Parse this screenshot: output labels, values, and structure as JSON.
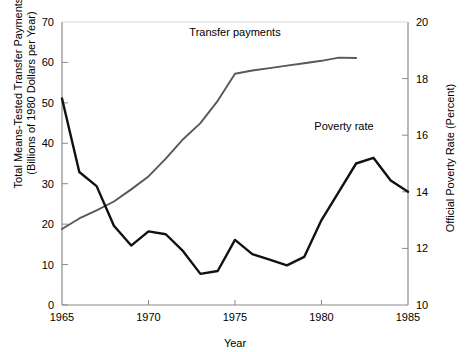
{
  "chart_data": {
    "type": "line",
    "title": "",
    "xlabel": "Year",
    "ylabel": "Total Means-Tested Transfer Payments (Billions of 1980 Dollars per Year)",
    "y2label": "Official Poverty Rate (Percent)",
    "xlim": [
      1965,
      1985
    ],
    "ylim": [
      0,
      70
    ],
    "y2lim": [
      10,
      20
    ],
    "grid": false,
    "legend_position": "inline-annotation",
    "xticks": [
      1965,
      1970,
      1975,
      1980,
      1985
    ],
    "xticklabels": [
      "1965",
      "1970",
      "1975",
      "1980",
      "1985"
    ],
    "yticks": [
      0,
      10,
      20,
      30,
      40,
      50,
      60,
      70
    ],
    "yticklabels": [
      "0",
      "10",
      "20",
      "30",
      "40",
      "50",
      "60",
      "70"
    ],
    "y2ticks": [
      10,
      12,
      14,
      16,
      18,
      20
    ],
    "y2ticklabels": [
      "10",
      "12",
      "14",
      "16",
      "18",
      "20"
    ],
    "series": [
      {
        "name": "Transfer payments",
        "axis": "left",
        "color": "#58585a",
        "x": [
          1965,
          1966,
          1967,
          1968,
          1969,
          1970,
          1971,
          1972,
          1973,
          1974,
          1975,
          1976,
          1977,
          1978,
          1979,
          1980,
          1981,
          1982
        ],
        "values": [
          18.8,
          21.4,
          23.4,
          25.6,
          28.6,
          31.8,
          36.2,
          41.0,
          45.0,
          50.5,
          57.2,
          58.0,
          58.6,
          59.2,
          59.8,
          60.4,
          61.2,
          61.1
        ]
      },
      {
        "name": "Poverty rate",
        "axis": "right",
        "color": "#111111",
        "x": [
          1965,
          1966,
          1967,
          1968,
          1969,
          1970,
          1971,
          1972,
          1973,
          1974,
          1975,
          1976,
          1977,
          1978,
          1979,
          1980,
          1981,
          1982,
          1983,
          1984,
          1985
        ],
        "values": [
          17.3,
          14.7,
          14.2,
          12.8,
          12.1,
          12.6,
          12.5,
          11.9,
          11.1,
          11.2,
          12.3,
          11.8,
          11.6,
          11.4,
          11.7,
          13.0,
          14.0,
          15.0,
          15.2,
          14.4,
          14.0
        ]
      }
    ],
    "annotations": [
      {
        "name": "transfer-payments-label",
        "text": "Transfer payments",
        "x": 1975.0,
        "y_axis": "left",
        "y": 66.5
      },
      {
        "name": "poverty-rate-label",
        "text": "Poverty rate",
        "x": 1981.3,
        "y_axis": "right",
        "y": 16.2
      }
    ]
  },
  "colors": {
    "transfer": "#58585a",
    "poverty": "#111111",
    "axis": "#8a8a8a",
    "text": "#000000",
    "background": "#ffffff"
  }
}
